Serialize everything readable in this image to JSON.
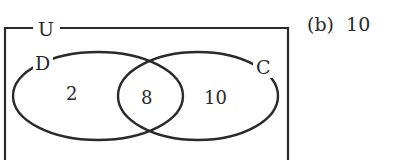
{
  "diagram": {
    "type": "venn",
    "universal_label": "U",
    "sets": [
      {
        "name": "D",
        "label": "D"
      },
      {
        "name": "C",
        "label": "C"
      }
    ],
    "regions": {
      "only_d": "2",
      "d_and_c": "8",
      "only_c": "10"
    },
    "stroke_color": "#2a2a2a"
  },
  "option": {
    "marker": "(b)",
    "value": "10"
  }
}
